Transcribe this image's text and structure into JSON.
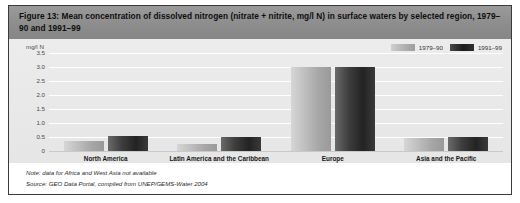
{
  "figure": {
    "title": "Figure 13: Mean concentration of dissolved nitrogen (nitrate + nitrite, mg/l N) in surface waters by selected region, 1979–90 and 1991–99",
    "note": "Note: data for Africa and West Asia not available",
    "source": "Source: GEO Data Portal, compiled from UNEP/GEMS-Water 2004"
  },
  "colors": {
    "title_bar": "#8d8d8d",
    "panel": "#e9e9e9",
    "series_1979_90": "#b3b3b3",
    "series_1991_99": "#232323",
    "border": "#3a3a3a",
    "gridline": "#ffffff"
  },
  "chart_data": {
    "type": "bar",
    "title": "Figure 13: Mean concentration of dissolved nitrogen (nitrate + nitrite, mg/l N) in surface waters by selected region, 1979–90 and 1991–99",
    "xlabel": "",
    "ylabel": "mg/l N",
    "ylim": [
      0,
      3.5
    ],
    "yticks": [
      "3.5",
      "3.0",
      "2.5",
      "2.0",
      "1.5",
      "1.0",
      "0.5",
      "0"
    ],
    "ytick_values": [
      3.5,
      3.0,
      2.5,
      2.0,
      1.5,
      1.0,
      0.5,
      0
    ],
    "grid": true,
    "legend_position": "top-right",
    "categories": [
      "North America",
      "Latin America and the Caribbean",
      "Europe",
      "Asia and the Pacific"
    ],
    "series": [
      {
        "name": "1979–90",
        "values": [
          0.35,
          0.25,
          3.0,
          0.45
        ]
      },
      {
        "name": "1991–99",
        "values": [
          0.55,
          0.5,
          3.0,
          0.5
        ]
      }
    ]
  }
}
